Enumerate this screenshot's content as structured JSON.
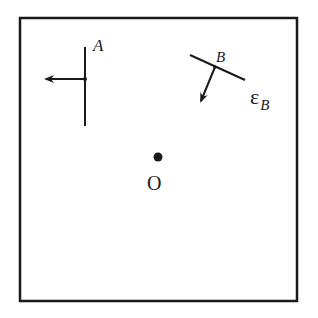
{
  "diagram": {
    "frame": {
      "x": 20,
      "y": 18,
      "width": 277,
      "height": 283
    },
    "labels": {
      "A": "A",
      "B": "B",
      "epsilon": "ε",
      "epsilon_sub": "B",
      "origin": "O"
    },
    "elements": {
      "A": {
        "line": [
          [
            85,
            47
          ],
          [
            85,
            126
          ]
        ],
        "point": [
          85,
          79
        ],
        "arrow": [
          [
            85,
            79
          ],
          [
            45,
            79
          ]
        ]
      },
      "B": {
        "line": [
          [
            190,
            55
          ],
          [
            245,
            80
          ]
        ],
        "point": [
          215,
          67
        ],
        "arrow": [
          [
            215,
            67
          ],
          [
            200,
            102
          ]
        ]
      },
      "O": {
        "point": [
          158,
          157
        ]
      }
    },
    "colors": {
      "ink": "#1a1a1a",
      "background": "#ffffff"
    }
  }
}
